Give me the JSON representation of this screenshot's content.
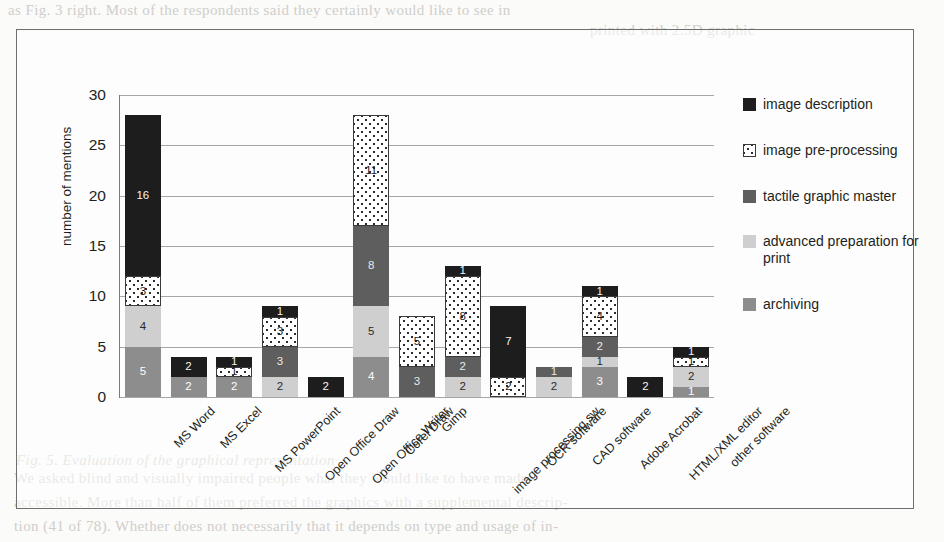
{
  "chart_data": {
    "type": "bar",
    "subtype": "stacked-bar",
    "title": "",
    "xlabel": "",
    "ylabel": "number of mentions",
    "ylim": [
      0,
      30
    ],
    "yticks": [
      0,
      5,
      10,
      15,
      20,
      25,
      30
    ],
    "grid": true,
    "legend_position": "right",
    "categories": [
      "MS Word",
      "MS Excel",
      "MS PowerPoint",
      "Open Office Draw",
      "Open Office Writer",
      "Corel Draw",
      "Gimp",
      "image processing sw",
      "OCR software",
      "CAD software",
      "Adobe Acrobat",
      "HTML/XML editor",
      "other software"
    ],
    "series": [
      {
        "name": "archiving",
        "color": "#8d8d8d",
        "values": [
          5,
          2,
          2,
          0,
          0,
          4,
          0,
          0,
          0,
          0,
          3,
          0,
          1
        ]
      },
      {
        "name": "advanced preparation for print",
        "color": "#cfcfcf",
        "values": [
          4,
          0,
          0,
          2,
          0,
          5,
          0,
          2,
          0,
          2,
          1,
          0,
          2
        ]
      },
      {
        "name": "tactile graphic master",
        "color": "#5e5e5e",
        "values": [
          0,
          0,
          0,
          3,
          0,
          8,
          3,
          2,
          0,
          1,
          2,
          0,
          0
        ]
      },
      {
        "name": "image pre-processing",
        "color": "#ffffff",
        "values": [
          3,
          0,
          1,
          3,
          0,
          11,
          5,
          8,
          2,
          0,
          4,
          0,
          1
        ]
      },
      {
        "name": "image description",
        "color": "#1d1d1d",
        "values": [
          16,
          2,
          1,
          1,
          2,
          0,
          0,
          1,
          7,
          0,
          1,
          2,
          1
        ]
      }
    ],
    "totals": [
      28,
      4,
      4,
      9,
      2,
      28,
      8,
      13,
      9,
      3,
      11,
      2,
      5
    ]
  },
  "legend": {
    "items": [
      {
        "label": "image description",
        "swatch": "solid-black-swatch"
      },
      {
        "label": "image pre-processing",
        "swatch": "dotted-white-swatch"
      },
      {
        "label": "tactile graphic master",
        "swatch": "solid-dark-gray-swatch"
      },
      {
        "label": "advanced preparation for print",
        "swatch": "solid-light-gray-swatch"
      },
      {
        "label": "archiving",
        "swatch": "solid-mid-gray-swatch"
      }
    ]
  },
  "bleed_through": {
    "top_line_1": "as Fig. 3 right. Most of the respondents said they certainly would like to see in",
    "top_line_2": "printed with 2.5D graphic",
    "bottom_caption": "Fig. 5. Evaluation of the graphical representation",
    "bottom_line_1": "We asked blind and visually impaired people what they would like to have made",
    "bottom_line_2": "accessible. More than half of them preferred the graphics with a supplemental descrip-",
    "bottom_line_3": "tion (41 of 78). Whether does not necessarily that it depends on type and usage of in-"
  }
}
